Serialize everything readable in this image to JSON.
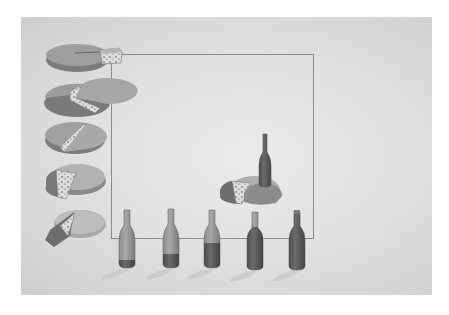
{
  "illustration": {
    "style": "pencil-and-wash drawing on textured paper",
    "palette": {
      "paper": "#e2e2e2",
      "paper_edge": "#cfcfcf",
      "frame_line": "#8a8a8a",
      "rind": "#8f8f8f",
      "rind_dark": "#6f6f6f",
      "cheese_top": "#a9a9a9",
      "cheese_cut": "#d9d9d9",
      "holes": "#5a5a5a",
      "glass": "#9a9a9a",
      "wine": "#5c5c5c",
      "shadow": "#c4c4c4"
    },
    "frame": {
      "x": 111,
      "y": 54,
      "width": 203,
      "height": 185
    },
    "y_axis_cheeses": [
      {
        "index": 1,
        "description": "whole wheel with a small wedge lifted out",
        "cx": 75,
        "cy": 57
      },
      {
        "index": 2,
        "description": "wheel with a wedge cut",
        "cx": 75,
        "cy": 100
      },
      {
        "index": 3,
        "description": "wheel with a thin cut slice",
        "cx": 75,
        "cy": 137
      },
      {
        "index": 4,
        "description": "wheel with a wedge removed",
        "cx": 75,
        "cy": 180
      },
      {
        "index": 5,
        "description": "wheel with a wedge leaning out",
        "cx": 75,
        "cy": 222
      }
    ],
    "x_axis_bottles": [
      {
        "index": 1,
        "x": 127,
        "fill_level": 0.1
      },
      {
        "index": 2,
        "x": 171,
        "fill_level": 0.3
      },
      {
        "index": 3,
        "x": 212,
        "fill_level": 0.6
      },
      {
        "index": 4,
        "x": 255,
        "fill_level": 0.9
      },
      {
        "index": 5,
        "x": 297,
        "fill_level": 1.0
      }
    ],
    "combination": {
      "description": "bottle standing on a cut cheese wheel inside the grid",
      "x": 250,
      "y": 168
    }
  }
}
